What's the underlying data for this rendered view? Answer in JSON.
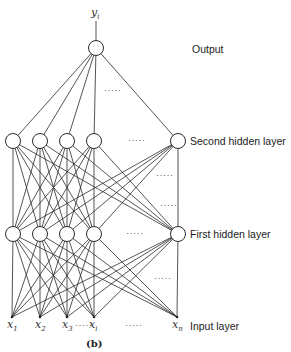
{
  "figure": {
    "caption": "(b)",
    "output_symbol": "y",
    "output_subscript": "i",
    "layer_labels": {
      "output": "Output",
      "second_hidden": "Second hidden layer",
      "first_hidden": "First hidden layer",
      "input": "Input layer"
    },
    "input_labels": [
      {
        "base": "x",
        "sub": "1"
      },
      {
        "base": "x",
        "sub": "2"
      },
      {
        "base": "x",
        "sub": "3"
      },
      {
        "base": "x",
        "sub": "i"
      },
      {
        "base": "x",
        "sub": "n"
      }
    ],
    "ellipsis": "·····",
    "input_gap_dots": "·····",
    "layers": {
      "output_x": [
        96
      ],
      "hidden_x": [
        13,
        40,
        67,
        94,
        178
      ],
      "input_x": [
        12,
        40,
        67,
        94,
        177
      ],
      "y": {
        "output": 48,
        "second_hidden": 141,
        "first_hidden": 234,
        "input": 317
      }
    }
  }
}
